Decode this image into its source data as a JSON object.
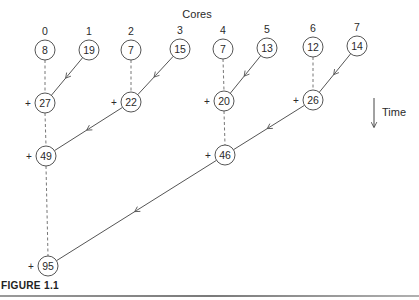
{
  "diagram": {
    "title": "Cores",
    "title_pos": [
      197,
      18
    ],
    "time_label": "Time",
    "time_arrow": {
      "x": 374,
      "y1": 98,
      "y2": 127,
      "label_x": 382,
      "label_y": 116
    },
    "node_radius": 10,
    "plus_sign": "+",
    "colors": {
      "stroke": "#555555",
      "text": "#2a2a2a",
      "dashed": "#777777"
    },
    "cores": [
      {
        "label": "0",
        "value": "8",
        "x": 45,
        "y": 50
      },
      {
        "label": "1",
        "value": "19",
        "x": 89,
        "y": 50
      },
      {
        "label": "2",
        "value": "7",
        "x": 131,
        "y": 50
      },
      {
        "label": "3",
        "value": "15",
        "x": 180,
        "y": 49
      },
      {
        "label": "4",
        "value": "7",
        "x": 223,
        "y": 49
      },
      {
        "label": "5",
        "value": "13",
        "x": 267,
        "y": 48
      },
      {
        "label": "6",
        "value": "12",
        "x": 313,
        "y": 47
      },
      {
        "label": "7",
        "value": "14",
        "x": 357,
        "y": 46
      }
    ],
    "sums": [
      {
        "id": "s27",
        "value": "27",
        "x": 45,
        "y": 103,
        "from_dashed": "c0",
        "from_arrow": "c1"
      },
      {
        "id": "s22",
        "value": "22",
        "x": 131,
        "y": 102,
        "from_dashed": "c2",
        "from_arrow": "c3"
      },
      {
        "id": "s20",
        "value": "20",
        "x": 224,
        "y": 101,
        "from_dashed": "c4",
        "from_arrow": "c5"
      },
      {
        "id": "s26",
        "value": "26",
        "x": 313,
        "y": 100,
        "from_dashed": "c6",
        "from_arrow": "c7"
      },
      {
        "id": "s49",
        "value": "49",
        "x": 46,
        "y": 156,
        "from_dashed": "s27",
        "from_arrow": "s22"
      },
      {
        "id": "s46",
        "value": "46",
        "x": 225,
        "y": 155,
        "from_dashed": "s20",
        "from_arrow": "s26"
      },
      {
        "id": "s95",
        "value": "95",
        "x": 48,
        "y": 266,
        "from_dashed": "s49",
        "from_arrow": "s46"
      }
    ]
  },
  "caption": {
    "label": "FIGURE 1.1"
  }
}
